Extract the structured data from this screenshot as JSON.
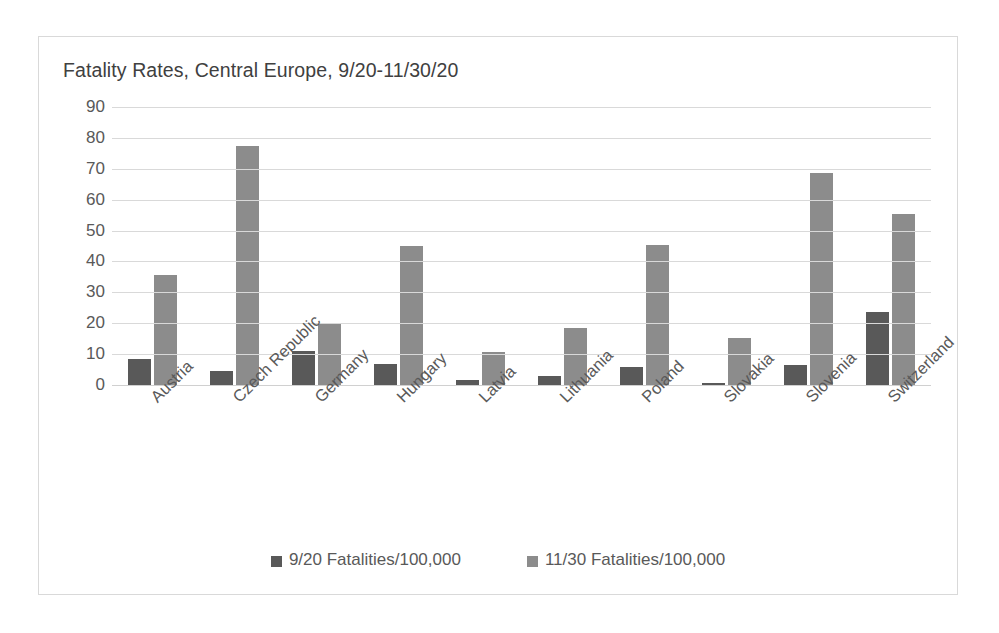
{
  "chart_data": {
    "type": "bar",
    "title": "Fatality Rates, Central Europe, 9/20-11/30/20",
    "xlabel": "",
    "ylabel": "",
    "ylim": [
      0,
      90
    ],
    "ytick_step": 10,
    "yticks": [
      90,
      80,
      70,
      60,
      50,
      40,
      30,
      20,
      10,
      0
    ],
    "grid": true,
    "legend_position": "bottom",
    "categories": [
      "Austria",
      "Czech Republic",
      "Germany",
      "Hungary",
      "Latvia",
      "Lithuania",
      "Poland",
      "Slovakia",
      "Slovenia",
      "Switzerland"
    ],
    "series": [
      {
        "name": "9/20 Fatalities/100,000",
        "color": "#595959",
        "values": [
          8.3,
          4.5,
          11.0,
          6.8,
          1.6,
          2.9,
          5.9,
          0.6,
          6.4,
          23.8
        ]
      },
      {
        "name": "11/30 Fatalities/100,000",
        "color": "#8c8c8c",
        "values": [
          35.6,
          77.5,
          20.1,
          45.0,
          10.6,
          18.3,
          45.2,
          15.2,
          68.8,
          55.3
        ]
      }
    ]
  },
  "colors": {
    "series_dark": "#595959",
    "series_light": "#8c8c8c",
    "gridline": "#d9d9d9",
    "border": "#d9d9d9",
    "text": "#595959",
    "title_text": "#404040",
    "background": "#ffffff"
  }
}
